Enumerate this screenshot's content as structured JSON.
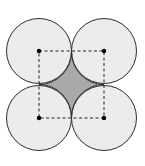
{
  "diagram": {
    "colors": {
      "circle_fill": "#ececec",
      "circle_stroke": "#2e2e2e",
      "shaded_region": "#a9a9a9",
      "center_dot": "#000000",
      "dashed_line": "#222222"
    },
    "radius": 32.5,
    "circles": [
      {
        "id": "top-left",
        "cx": 39,
        "cy": 51
      },
      {
        "id": "top-right",
        "cx": 104,
        "cy": 51
      },
      {
        "id": "bottom-left",
        "cx": 39,
        "cy": 118
      },
      {
        "id": "bottom-right",
        "cx": 104,
        "cy": 118
      }
    ]
  }
}
